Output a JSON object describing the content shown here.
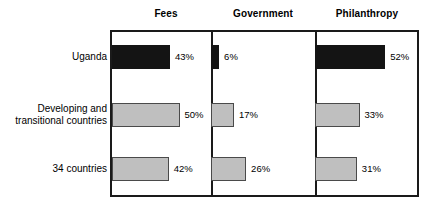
{
  "chart_data": {
    "type": "bar",
    "orientation": "horizontal",
    "title": "",
    "xlabel": "",
    "ylabel": "",
    "grid": false,
    "legend_position": "none",
    "value_suffix": "%",
    "xlim": [
      0,
      55
    ],
    "panel_headers": [
      "Fees",
      "Government",
      "Philanthropy"
    ],
    "categories": [
      "Uganda",
      "Developing and\ntransitional countries",
      "34 countries"
    ],
    "series": [
      {
        "name": "Fees",
        "values": [
          43,
          50,
          42
        ]
      },
      {
        "name": "Government",
        "values": [
          6,
          17,
          26
        ]
      },
      {
        "name": "Philanthropy",
        "values": [
          52,
          33,
          31
        ]
      }
    ],
    "value_labels": [
      [
        "43%",
        "6%",
        "52%"
      ],
      [
        "50%",
        "17%",
        "33%"
      ],
      [
        "42%",
        "26%",
        "31%"
      ]
    ],
    "bar_styles": [
      [
        "dark",
        "dark",
        "dark"
      ],
      [
        "light",
        "light",
        "light"
      ],
      [
        "light",
        "light",
        "light"
      ]
    ],
    "colors": {
      "dark_fill": "#141414",
      "light_fill": "#bfbfbf",
      "bar_border": "#2b2b2b",
      "frame": "#1a1a1a",
      "text": "#000000",
      "background": "#ffffff"
    }
  }
}
